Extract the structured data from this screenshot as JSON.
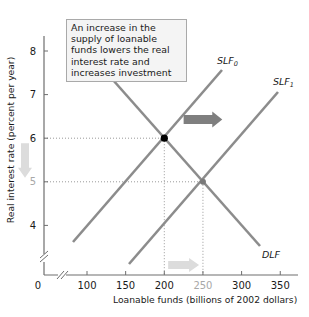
{
  "chart_data": {
    "type": "line",
    "title": "",
    "annotation": "An increase in the supply of loanable funds lowers the real interest rate and increases investment",
    "xlabel": "Loanable funds (billions of 2002 dollars)",
    "ylabel": "Real interest rate (percent per year)",
    "xlim": [
      0,
      375
    ],
    "ylim": [
      3,
      8.5
    ],
    "x_ticks": [
      "0",
      "100",
      "150",
      "200",
      "250",
      "300",
      "350"
    ],
    "y_ticks": [
      "4",
      "5",
      "6",
      "7",
      "8"
    ],
    "highlighted_ticks": {
      "x": "250",
      "y": "5"
    },
    "axis_breaks": true,
    "grid": false,
    "series": [
      {
        "name": "SLF0",
        "label_main": "SLF",
        "label_sub": "0",
        "points": [
          [
            80,
            3.4
          ],
          [
            275,
            7.2
          ]
        ]
      },
      {
        "name": "SLF1",
        "label_main": "SLF",
        "label_sub": "1",
        "points": [
          [
            155,
            2.9
          ],
          [
            350,
            6.7
          ]
        ]
      },
      {
        "name": "DLF",
        "label_main": "DLF",
        "label_sub": "",
        "points": [
          [
            135,
            7.3
          ],
          [
            325,
            3.5
          ]
        ]
      }
    ],
    "equilibria": [
      {
        "name": "initial",
        "x": 200,
        "y": 6,
        "color": "#000000"
      },
      {
        "name": "new",
        "x": 250,
        "y": 5,
        "color": "#7a7a7a"
      }
    ],
    "arrows": [
      {
        "name": "supply-shift",
        "direction": "right",
        "from_x": 225,
        "to_x": 275,
        "y": 6.5,
        "color": "#7f7f7f"
      },
      {
        "name": "rate-falls",
        "direction": "down",
        "x": 25,
        "from_y": 6,
        "to_y": 5,
        "color": "#dcdcdc"
      },
      {
        "name": "funds-increase",
        "direction": "right",
        "from_x": 205,
        "to_x": 245,
        "y": 3.2,
        "color": "#dcdcdc"
      }
    ],
    "caption": "(a) A change in the supply"
  },
  "colors": {
    "curve": "#8c8c8c",
    "axis": "#6e6e6e",
    "text": "#1a1a1a",
    "muted_tick": "#a8a8a8",
    "dotted_guide": "#999999"
  }
}
